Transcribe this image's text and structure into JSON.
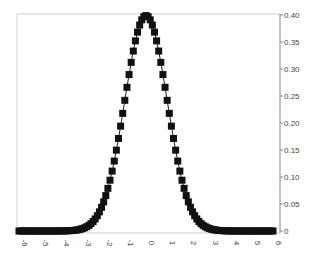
{
  "chart_data": {
    "type": "line",
    "title": "",
    "xlabel": "",
    "ylabel": "",
    "xlim": [
      -6,
      6
    ],
    "ylim": [
      0,
      0.4
    ],
    "grid": false,
    "legend": null,
    "y_axis_position": "right",
    "x_tick_rotation": 90,
    "x_ticks": [
      "-6",
      "-5",
      "-4",
      "-3",
      "-2",
      "-1",
      "0",
      "1",
      "2",
      "3",
      "4",
      "5",
      "6"
    ],
    "y_ticks": [
      "0",
      "0.05",
      "0.10",
      "0.15",
      "0.20",
      "0.25",
      "0.30",
      "0.35",
      "0.40"
    ],
    "series": [
      {
        "name": "standard normal pdf",
        "marker": "square",
        "line": true,
        "color": "#111111",
        "x_start": -6,
        "x_end": 6,
        "x_step": 0.1,
        "x": [
          -3,
          -2.5,
          -2,
          -1.5,
          -1,
          -0.5,
          0,
          0.5,
          1,
          1.5,
          2,
          2.5,
          3
        ],
        "values": [
          0.004,
          0.018,
          0.054,
          0.13,
          0.242,
          0.352,
          0.399,
          0.352,
          0.242,
          0.13,
          0.054,
          0.018,
          0.004
        ]
      }
    ]
  },
  "colors": {
    "frame": "#c8c8c8",
    "axis": "#888888",
    "marker": "#111111"
  }
}
